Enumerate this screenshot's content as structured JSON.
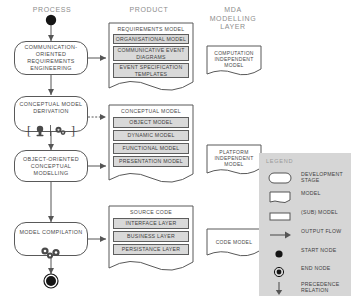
{
  "diagram": {
    "columns": [
      {
        "name": "process",
        "label": "PROCESS"
      },
      {
        "name": "product",
        "label": "PRODUCT"
      },
      {
        "name": "mda",
        "label": "MDA\nMODELLING\nLAYER"
      }
    ],
    "process_stages": [
      {
        "id": "comm-req-eng",
        "label": "COMMUNICATION-\nORIENTED\nREQUIREMENTS\nENGINEERING",
        "icon": "none"
      },
      {
        "id": "conceptual-model-derivation",
        "label": "CONCEPTUAL MODEL\nDERIVATION",
        "icon": "manual-or-automated-icon"
      },
      {
        "id": "oo-conceptual-modelling",
        "label": "OBJECT-ORIENTED\nCONCEPTUAL\nMODELLING",
        "icon": "none"
      },
      {
        "id": "model-compilation",
        "label": "MODEL COMPILATION",
        "icon": "gears-icon"
      }
    ],
    "start_node": {
      "name": "start-node"
    },
    "end_node": {
      "name": "end-node"
    },
    "products": [
      {
        "id": "requirements-model",
        "title": "REQUIREMENTS MODEL",
        "submodels": [
          "ORGANISATIONAL MODEL",
          "COMMUNICATIVE EVENT\nDIAGRAMS",
          "EVENT SPECIFICATION\nTEMPLATES"
        ]
      },
      {
        "id": "conceptual-model",
        "title": "CONCEPTUAL MODEL",
        "submodels": [
          "OBJECT MODEL",
          "DYNAMIC MODEL",
          "FUNCTIONAL MODEL",
          "PRESENTATION MODEL"
        ]
      },
      {
        "id": "source-code",
        "title": "SOURCE CODE",
        "submodels": [
          "INTERFACE LAYER",
          "BUSINESS LAYER",
          "PERSISTANCE LAYER"
        ]
      }
    ],
    "mda_models": [
      {
        "id": "computation-independent-model",
        "label": "COMPUTATION\nINDEPENDENT\nMODEL"
      },
      {
        "id": "platform-independent-model",
        "label": "PLATFORM\nINDEPENDENT\nMODEL"
      },
      {
        "id": "code-model",
        "label": "CODE MODEL"
      }
    ],
    "legend": {
      "title": "LEGEND",
      "items": [
        {
          "symbol": "rounded-rectangle",
          "label": "DEVELOPMENT\nSTAGE"
        },
        {
          "symbol": "document-shape",
          "label": "MODEL"
        },
        {
          "symbol": "rectangle",
          "label": "(SUB) MODEL"
        },
        {
          "symbol": "arrow-right",
          "label": "OUTPUT FLOW"
        },
        {
          "symbol": "filled-circle",
          "label": "START NODE"
        },
        {
          "symbol": "circled-dot",
          "label": "END NODE"
        },
        {
          "symbol": "arrow-down",
          "label": "PRECEDENCE\nRELATION"
        }
      ]
    },
    "colors": {
      "stroke": "#595959",
      "submodel_fill": "#d9d9d9",
      "legend_fill": "#d6d6d6",
      "header_text": "#8d8d8d",
      "body_text": "#3f3f3f"
    }
  }
}
